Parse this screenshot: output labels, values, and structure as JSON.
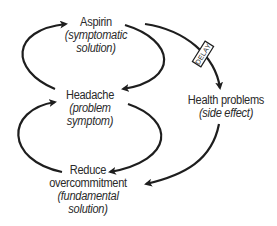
{
  "diagram": {
    "type": "causal-loop",
    "nodes": {
      "aspirin": {
        "title": "Aspirin",
        "subtitle_line1": "(symptomatic",
        "subtitle_line2": "solution)"
      },
      "headache": {
        "title": "Headache",
        "subtitle_line1": "(problem",
        "subtitle_line2": "symptom)"
      },
      "health_problems": {
        "title": "Health problems",
        "subtitle_line1": "(side effect)"
      },
      "reduce_overcommitment": {
        "title_line1": "Reduce",
        "title_line2": "overcommitment",
        "subtitle_line1": "(fundamental",
        "subtitle_line2": "solution)"
      }
    },
    "delay_label": "DELAY",
    "links": [
      {
        "from": "Headache",
        "to": "Aspirin"
      },
      {
        "from": "Aspirin",
        "to": "Headache"
      },
      {
        "from": "Headache",
        "to": "Reduce overcommitment"
      },
      {
        "from": "Reduce overcommitment",
        "to": "Headache"
      },
      {
        "from": "Aspirin",
        "to": "Health problems",
        "delay": true
      },
      {
        "from": "Health problems",
        "to": "Reduce overcommitment"
      }
    ],
    "colors": {
      "stroke": "#1e1e1e",
      "text": "#2a2a2a",
      "background": "#ffffff"
    }
  }
}
